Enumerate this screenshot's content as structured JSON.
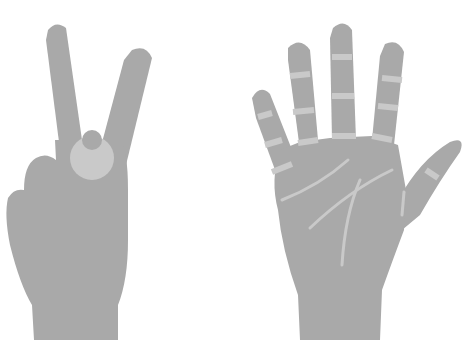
{
  "scene": {
    "description": "Two gray hand illustrations on white background",
    "background": "#ffffff",
    "skin_color": "#a9a9a9",
    "highlight_color": "#c9c9c9"
  },
  "hands": [
    {
      "name": "peace-sign-hand",
      "gesture": "two fingers raised (V sign)"
    },
    {
      "name": "open-palm-hand",
      "gesture": "open palm with five fingers spread"
    }
  ]
}
